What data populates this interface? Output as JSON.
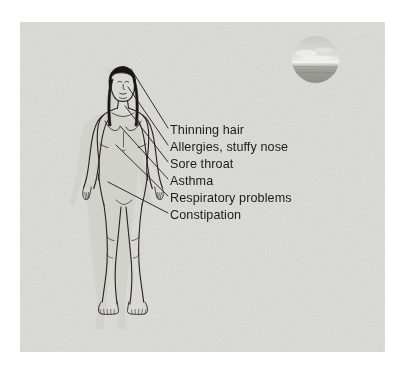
{
  "diagram": {
    "figure": {
      "name": "standing-female-figure",
      "description": "Line-drawn anterior view of a standing nude female figure with long dark hair",
      "hair_color": "#1a1613",
      "outline_color": "#2b2623",
      "skin_fill": "#cfcfc9"
    },
    "inset": {
      "name": "circular-landscape-photo",
      "description": "Small circular grayscale photograph of a hazy horizon landscape",
      "shape": "circle",
      "diameter_px": 47
    },
    "leader_lines": {
      "count": 6,
      "color": "#2a2522",
      "description": "Thin straight lines fanning from the figure's head, neck, chest and abdomen to each symptom label"
    },
    "labels": [
      {
        "id": "thinning-hair",
        "text": "Thinning hair"
      },
      {
        "id": "allergies-stuffy-nose",
        "text": "Allergies, stuffy nose"
      },
      {
        "id": "sore-throat",
        "text": "Sore throat"
      },
      {
        "id": "asthma",
        "text": "Asthma"
      },
      {
        "id": "respiratory-problems",
        "text": "Respiratory problems"
      },
      {
        "id": "constipation",
        "text": "Constipation"
      }
    ],
    "colors": {
      "panel_background": "#dcdcd8",
      "page_background": "#ffffff",
      "text": "#1c1c1c",
      "line": "#2a2522"
    }
  }
}
